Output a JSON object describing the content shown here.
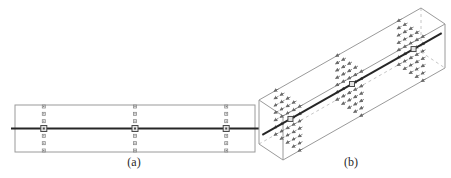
{
  "figure": {
    "labels": {
      "a": "(a)",
      "b": "(b)"
    },
    "colors": {
      "background": "#ffffff",
      "outline": "#9a9a9a",
      "hidden_edge": "#c6c6c6",
      "axis": "#262626",
      "marker": "#8a8a8a",
      "marker_dark": "#555555",
      "arrow": "#6a6a6a",
      "center_square_fill": "#e3e3e3",
      "center_square_border": "#4a4a4a"
    },
    "panel_a": {
      "rect": {
        "x": 15,
        "y": 105,
        "w": 240,
        "h": 47
      },
      "centerline_overhang": 4,
      "stations": [
        0.12,
        0.5,
        0.88
      ],
      "markers_per_column": 7,
      "marker_size": 3,
      "center_square_size": 6
    },
    "panel_b": {
      "origin": [
        259,
        100
      ],
      "axis_vec": [
        162,
        -92
      ],
      "depth_vec": [
        24,
        16
      ],
      "height_vec": [
        0,
        44
      ],
      "stations": [
        0.12,
        0.5,
        0.88
      ],
      "grid_cols": 5,
      "grid_rows": 7,
      "axis_overhang": 10,
      "arrow_len": 5,
      "center_square_size": 5
    }
  }
}
